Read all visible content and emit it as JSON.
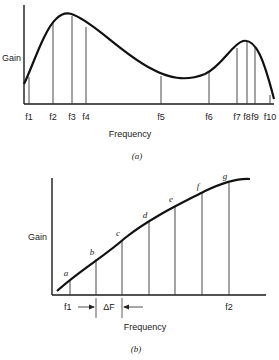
{
  "figure_a": {
    "y_label": "Gain",
    "x_label": "Frequency",
    "caption": "(a)",
    "ticks": [
      {
        "label": "f1",
        "x": 29,
        "top": 77
      },
      {
        "label": "f2",
        "x": 53,
        "top": 22
      },
      {
        "label": "f3",
        "x": 72,
        "top": 16
      },
      {
        "label": "f4",
        "x": 86,
        "top": 27
      },
      {
        "label": "f5",
        "x": 161,
        "top": 76
      },
      {
        "label": "f6",
        "x": 209,
        "top": 72
      },
      {
        "label": "f7",
        "x": 237,
        "top": 48
      },
      {
        "label": "f8",
        "x": 247,
        "top": 42
      },
      {
        "label": "f9",
        "x": 255,
        "top": 48
      },
      {
        "label": "f10",
        "x": 270,
        "top": 95
      }
    ]
  },
  "figure_b": {
    "y_label": "Gain",
    "x_label": "Frequency",
    "caption": "(b)",
    "f1_label": "f1",
    "f2_label": "f2",
    "delta_label": "ΔF",
    "points": [
      {
        "label": "a",
        "x": 70,
        "top": 280
      },
      {
        "label": "b",
        "x": 96,
        "top": 259
      },
      {
        "label": "c",
        "x": 122,
        "top": 240
      },
      {
        "label": "d",
        "x": 149,
        "top": 222
      },
      {
        "label": "e",
        "x": 175,
        "top": 206
      },
      {
        "label": "f",
        "x": 202,
        "top": 193
      },
      {
        "label": "g",
        "x": 229,
        "top": 183
      }
    ]
  }
}
